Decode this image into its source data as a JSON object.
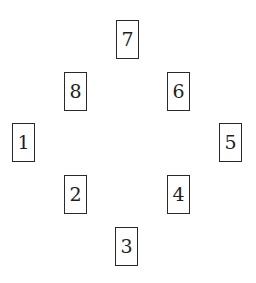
{
  "diagram": {
    "type": "spread-layout",
    "cards": [
      {
        "label": "1",
        "x": 12,
        "y": 123
      },
      {
        "label": "2",
        "x": 64,
        "y": 175
      },
      {
        "label": "3",
        "x": 115,
        "y": 227
      },
      {
        "label": "4",
        "x": 167,
        "y": 175
      },
      {
        "label": "5",
        "x": 219,
        "y": 123
      },
      {
        "label": "6",
        "x": 167,
        "y": 72
      },
      {
        "label": "7",
        "x": 116,
        "y": 20
      },
      {
        "label": "8",
        "x": 64,
        "y": 72
      }
    ]
  },
  "colors": {
    "border": "#2a2a2a",
    "text": "#1e1e1e",
    "background": "#ffffff"
  }
}
